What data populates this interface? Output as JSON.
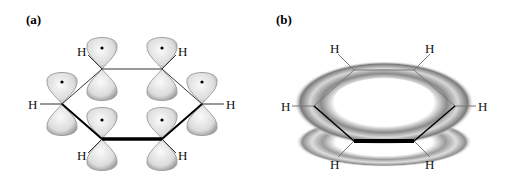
{
  "panels": [
    {
      "id": "a",
      "label": "(a)",
      "description": "p orbitals on six carbon atoms of benzene ring"
    },
    {
      "id": "b",
      "label": "(b)",
      "description": "delocalized pi electron clouds above and below ring"
    }
  ],
  "atom_label": "H",
  "colors": {
    "lobe_fill": "#e6e6e6",
    "lobe_edge": "#9a9a9a",
    "bond": "#333333",
    "bold_bond": "#000000"
  }
}
